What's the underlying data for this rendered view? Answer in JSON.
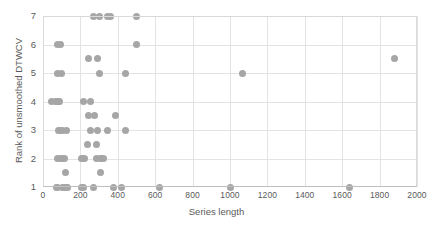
{
  "chart_data": {
    "type": "scatter",
    "title": "",
    "xlabel": "Series length",
    "ylabel": "Rank of unsmoothed DTWCV",
    "xlim": [
      0,
      2000
    ],
    "ylim": [
      1,
      7
    ],
    "xticks": [
      0,
      200,
      400,
      600,
      800,
      1000,
      1200,
      1400,
      1600,
      1800,
      2000
    ],
    "yticks": [
      1,
      2,
      3,
      4,
      5,
      6,
      7
    ],
    "grid": true,
    "legend": "none",
    "marker_color": "#a6a6a6",
    "marker_size": 7,
    "series": [
      {
        "name": "datasets",
        "points": [
          [
            270,
            7
          ],
          [
            300,
            7
          ],
          [
            345,
            7
          ],
          [
            360,
            7
          ],
          [
            500,
            7
          ],
          [
            80,
            6
          ],
          [
            95,
            6
          ],
          [
            500,
            6
          ],
          [
            245,
            5.5
          ],
          [
            290,
            5.5
          ],
          [
            1880,
            5.5
          ],
          [
            80,
            5
          ],
          [
            100,
            5
          ],
          [
            300,
            5
          ],
          [
            440,
            5
          ],
          [
            1065,
            5
          ],
          [
            45,
            4
          ],
          [
            68,
            4
          ],
          [
            75,
            4
          ],
          [
            82,
            4
          ],
          [
            90,
            4
          ],
          [
            215,
            4
          ],
          [
            255,
            4
          ],
          [
            245,
            3.5
          ],
          [
            275,
            3.5
          ],
          [
            390,
            3.5
          ],
          [
            85,
            3
          ],
          [
            95,
            3
          ],
          [
            102,
            3
          ],
          [
            128,
            3
          ],
          [
            255,
            3
          ],
          [
            293,
            3
          ],
          [
            345,
            3
          ],
          [
            440,
            3
          ],
          [
            240,
            2.5
          ],
          [
            285,
            2.5
          ],
          [
            80,
            2
          ],
          [
            95,
            2
          ],
          [
            105,
            2
          ],
          [
            113,
            2
          ],
          [
            205,
            2
          ],
          [
            213,
            2
          ],
          [
            222,
            2
          ],
          [
            285,
            2
          ],
          [
            305,
            2
          ],
          [
            315,
            2
          ],
          [
            325,
            2
          ],
          [
            120,
            1.5
          ],
          [
            310,
            1.5
          ],
          [
            70,
            1
          ],
          [
            80,
            1
          ],
          [
            105,
            1
          ],
          [
            115,
            1
          ],
          [
            125,
            1
          ],
          [
            132,
            1
          ],
          [
            205,
            1
          ],
          [
            215,
            1
          ],
          [
            270,
            1
          ],
          [
            375,
            1
          ],
          [
            418,
            1
          ],
          [
            625,
            1
          ],
          [
            1000,
            1
          ],
          [
            1640,
            1
          ]
        ]
      }
    ]
  },
  "axes": {
    "x_tick_labels": [
      "0",
      "200",
      "400",
      "600",
      "800",
      "1000",
      "1200",
      "1400",
      "1600",
      "1800",
      "2000"
    ],
    "y_tick_labels": [
      "1",
      "2",
      "3",
      "4",
      "5",
      "6",
      "7"
    ]
  }
}
